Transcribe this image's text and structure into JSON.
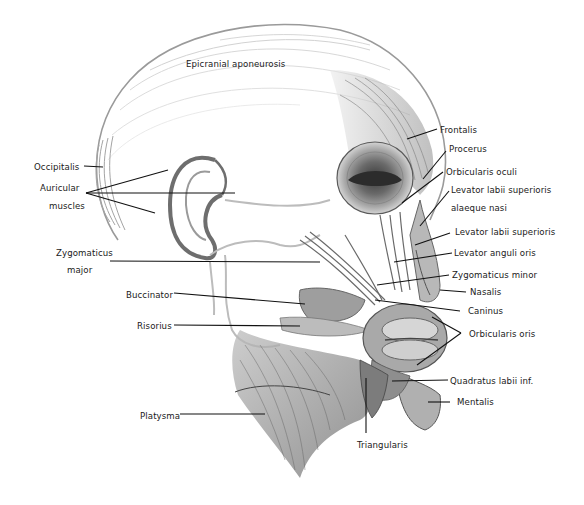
{
  "diagram": {
    "labels": [
      {
        "id": "epicranial-aponeurosis",
        "text": "Epicranial aponeurosis",
        "x": 186,
        "y": 59
      },
      {
        "id": "occipitalis",
        "text": "Occipitalis",
        "x": 34,
        "y": 162
      },
      {
        "id": "auricular-1",
        "text": "Auricular",
        "x": 40,
        "y": 183
      },
      {
        "id": "auricular-2",
        "text": "muscles",
        "x": 49,
        "y": 201
      },
      {
        "id": "zygomaticus-major-1",
        "text": "Zygomaticus",
        "x": 56,
        "y": 248
      },
      {
        "id": "zygomaticus-major-2",
        "text": "major",
        "x": 67,
        "y": 265
      },
      {
        "id": "buccinator",
        "text": "Buccinator",
        "x": 126,
        "y": 290
      },
      {
        "id": "risorius",
        "text": "Risorius",
        "x": 137,
        "y": 321
      },
      {
        "id": "platysma",
        "text": "Platysma",
        "x": 140,
        "y": 411
      },
      {
        "id": "triangularis",
        "text": "Triangularis",
        "x": 357,
        "y": 440
      },
      {
        "id": "frontalis",
        "text": "Frontalis",
        "x": 440,
        "y": 125
      },
      {
        "id": "procerus",
        "text": "Procerus",
        "x": 449,
        "y": 144
      },
      {
        "id": "orbicularis-oculi",
        "text": "Orbicularis oculi",
        "x": 446,
        "y": 167
      },
      {
        "id": "levator-labii-sup-alae-1",
        "text": "Levator labii superioris",
        "x": 451,
        "y": 185
      },
      {
        "id": "levator-labii-sup-alae-2",
        "text": "alaeque nasi",
        "x": 451,
        "y": 203
      },
      {
        "id": "levator-labii-superioris",
        "text": "Levator labii superioris",
        "x": 455,
        "y": 227
      },
      {
        "id": "levator-anguli-oris",
        "text": "Levator anguli oris",
        "x": 454,
        "y": 248
      },
      {
        "id": "zygomaticus-minor",
        "text": "Zygomaticus minor",
        "x": 452,
        "y": 270
      },
      {
        "id": "nasalis",
        "text": "Nasalis",
        "x": 470,
        "y": 287
      },
      {
        "id": "caninus",
        "text": "Caninus",
        "x": 468,
        "y": 306
      },
      {
        "id": "orbicularis-oris",
        "text": "Orbicularis oris",
        "x": 469,
        "y": 329
      },
      {
        "id": "quadratus-labii-inf",
        "text": "Quadratus labii inf.",
        "x": 450,
        "y": 376
      },
      {
        "id": "mentalis",
        "text": "Mentalis",
        "x": 457,
        "y": 397
      }
    ]
  },
  "colors": {
    "background": "#ffffff",
    "label_text": "#1a1a1a",
    "leader_line": "#111111",
    "outline": "#8a8a8a",
    "muscle_dark": "#5a5a5a",
    "muscle_mid": "#9a9a9a",
    "muscle_light": "#cfcfcf"
  }
}
